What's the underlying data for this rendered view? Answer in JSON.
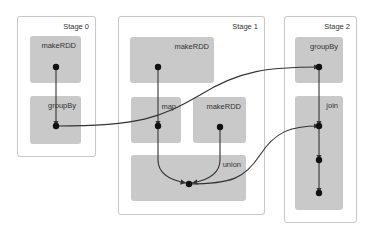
{
  "diagram": {
    "type": "spark-dag-visualization",
    "stages": [
      {
        "id": "stage0",
        "label": "Stage 0",
        "box": {
          "x": 17,
          "y": 16,
          "w": 77,
          "h": 139
        },
        "rdds": [
          {
            "id": "s0_makeRDD",
            "label": "makeRDD",
            "box": {
              "x": 30,
              "y": 36,
              "w": 51,
              "h": 47
            }
          },
          {
            "id": "s0_groupBy",
            "label": "groupBy",
            "box": {
              "x": 30,
              "y": 96,
              "w": 51,
              "h": 48
            }
          }
        ]
      },
      {
        "id": "stage1",
        "label": "Stage 1",
        "box": {
          "x": 118,
          "y": 16,
          "w": 145,
          "h": 197
        },
        "rdds": [
          {
            "id": "s1_makeRDD_a",
            "label": "makeRDD",
            "box": {
              "x": 130,
              "y": 37,
              "w": 84,
              "h": 46
            }
          },
          {
            "id": "s1_map",
            "label": "map",
            "box": {
              "x": 131,
              "y": 97,
              "w": 50,
              "h": 46
            }
          },
          {
            "id": "s1_makeRDD_b",
            "label": "makeRDD",
            "box": {
              "x": 193,
              "y": 97,
              "w": 53,
              "h": 46
            }
          },
          {
            "id": "s1_union",
            "label": "union",
            "box": {
              "x": 131,
              "y": 155,
              "w": 115,
              "h": 46
            }
          }
        ]
      },
      {
        "id": "stage2",
        "label": "Stage 2",
        "box": {
          "x": 284,
          "y": 16,
          "w": 71,
          "h": 205
        },
        "rdds": [
          {
            "id": "s2_groupBy",
            "label": "groupBy",
            "box": {
              "x": 295,
              "y": 37,
              "w": 48,
              "h": 46
            }
          },
          {
            "id": "s2_join",
            "label": "join",
            "box": {
              "x": 295,
              "y": 96,
              "w": 48,
              "h": 114
            }
          }
        ]
      }
    ],
    "nodes": [
      {
        "id": "n1",
        "x": 56,
        "y": 67
      },
      {
        "id": "n2",
        "x": 56,
        "y": 126
      },
      {
        "id": "n3",
        "x": 158,
        "y": 67
      },
      {
        "id": "n4",
        "x": 158,
        "y": 126
      },
      {
        "id": "n5",
        "x": 220,
        "y": 127
      },
      {
        "id": "n6",
        "x": 189,
        "y": 184
      },
      {
        "id": "n7",
        "x": 319,
        "y": 67
      },
      {
        "id": "n8",
        "x": 319,
        "y": 126
      },
      {
        "id": "n9",
        "x": 319,
        "y": 160
      },
      {
        "id": "n10",
        "x": 319,
        "y": 193
      }
    ],
    "edges": [
      {
        "from": "n1",
        "to": "n2",
        "path": "M56,67 L56,126"
      },
      {
        "from": "n3",
        "to": "n4",
        "path": "M158,67 L158,126"
      },
      {
        "from": "n4",
        "to": "n6",
        "path": "M158,126 L158,160 Q158,178 186,183"
      },
      {
        "from": "n5",
        "to": "n6",
        "path": "M220,127 L220,160 Q220,178 192,183"
      },
      {
        "from": "n2",
        "to": "n7",
        "path": "M56,126 C140,126 160,118 200,95 C240,70 270,67 319,67"
      },
      {
        "from": "n6",
        "to": "n8",
        "path": "M189,184 C232,184 245,178 260,155 C275,132 290,126 319,126"
      },
      {
        "from": "n7",
        "to": "n8",
        "path": "M319,67 L319,126"
      },
      {
        "from": "n8",
        "to": "n9",
        "path": "M319,126 L319,160"
      },
      {
        "from": "n9",
        "to": "n10",
        "path": "M319,160 L319,193"
      }
    ],
    "colors": {
      "stage_border": "#c8c8c8",
      "rdd_fill": "#c9c9c9",
      "edge": "#333333",
      "node": "#111111",
      "label": "#333333"
    }
  }
}
